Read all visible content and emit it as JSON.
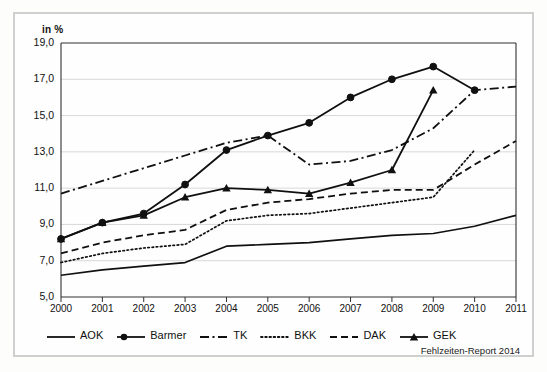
{
  "figure": {
    "unit_label": "in %",
    "source_note": "Fehlzeiten-Report 2014",
    "frame_color": "#cfcfcf",
    "background_color": "#fefefe",
    "line_color": "#101010",
    "grid_color": "#d8d8d8"
  },
  "legend": {
    "position": "bottom",
    "items": [
      {
        "label": "AOK",
        "style": "solid",
        "marker": "none"
      },
      {
        "label": "Barmer",
        "style": "solid",
        "marker": "circle"
      },
      {
        "label": "TK",
        "style": "dash-dot",
        "marker": "none"
      },
      {
        "label": "BKK",
        "style": "dotted",
        "marker": "none"
      },
      {
        "label": "DAK",
        "style": "dashed",
        "marker": "none"
      },
      {
        "label": "GEK",
        "style": "solid",
        "marker": "triangle"
      }
    ]
  },
  "chart_data": {
    "type": "line",
    "title": "",
    "subtitle": "",
    "xlabel": "",
    "ylabel": "in %",
    "xlim": [
      2000,
      2011
    ],
    "ylim": [
      5.0,
      19.0
    ],
    "ytick_step": 2.0,
    "grid": true,
    "legend_position": "bottom",
    "categories": [
      2000,
      2001,
      2002,
      2003,
      2004,
      2005,
      2006,
      2007,
      2008,
      2009,
      2010,
      2011
    ],
    "xticks": [
      "2000",
      "2001",
      "2002",
      "2003",
      "2004",
      "2005",
      "2006",
      "2007",
      "2008",
      "2009",
      "2010",
      "2011"
    ],
    "yticks": [
      "5,0",
      "7,0",
      "9,0",
      "11,0",
      "13,0",
      "15,0",
      "17,0",
      "19,0"
    ],
    "ytick_values": [
      5.0,
      7.0,
      9.0,
      11.0,
      13.0,
      15.0,
      17.0,
      19.0
    ],
    "series": [
      {
        "name": "AOK",
        "style": "solid",
        "marker": "none",
        "x": [
          2000,
          2001,
          2002,
          2003,
          2004,
          2005,
          2006,
          2007,
          2008,
          2009,
          2010,
          2011
        ],
        "values": [
          6.2,
          6.5,
          6.7,
          6.9,
          7.8,
          7.9,
          8.0,
          8.2,
          8.4,
          8.5,
          8.9,
          9.5
        ]
      },
      {
        "name": "Barmer",
        "style": "solid",
        "marker": "circle",
        "x": [
          2000,
          2001,
          2002,
          2003,
          2004,
          2005,
          2006,
          2007,
          2008,
          2009,
          2010
        ],
        "values": [
          8.2,
          9.1,
          9.6,
          11.2,
          13.1,
          13.9,
          14.6,
          16.0,
          17.0,
          17.7,
          16.4
        ]
      },
      {
        "name": "TK",
        "style": "dash-dot",
        "marker": "none",
        "x": [
          2000,
          2001,
          2002,
          2003,
          2004,
          2005,
          2006,
          2007,
          2008,
          2009,
          2010,
          2011
        ],
        "values": [
          10.7,
          11.4,
          12.1,
          12.8,
          13.5,
          13.9,
          12.3,
          12.5,
          13.1,
          14.3,
          16.4,
          16.6
        ]
      },
      {
        "name": "BKK",
        "style": "dotted",
        "marker": "none",
        "x": [
          2000,
          2001,
          2002,
          2003,
          2004,
          2005,
          2006,
          2007,
          2008,
          2009,
          2010
        ],
        "values": [
          6.9,
          7.4,
          7.7,
          7.9,
          9.2,
          9.5,
          9.6,
          9.9,
          10.2,
          10.5,
          13.1
        ]
      },
      {
        "name": "DAK",
        "style": "dashed",
        "marker": "none",
        "x": [
          2000,
          2001,
          2002,
          2003,
          2004,
          2005,
          2006,
          2007,
          2008,
          2009,
          2010,
          2011
        ],
        "values": [
          7.4,
          8.0,
          8.4,
          8.7,
          9.8,
          10.2,
          10.4,
          10.7,
          10.9,
          10.9,
          12.3,
          13.6
        ]
      },
      {
        "name": "GEK",
        "style": "solid",
        "marker": "triangle",
        "x": [
          2000,
          2001,
          2002,
          2003,
          2004,
          2005,
          2006,
          2007,
          2008,
          2009
        ],
        "values": [
          8.2,
          9.1,
          9.5,
          10.5,
          11.0,
          10.9,
          10.7,
          11.3,
          12.0,
          16.4
        ]
      }
    ]
  }
}
